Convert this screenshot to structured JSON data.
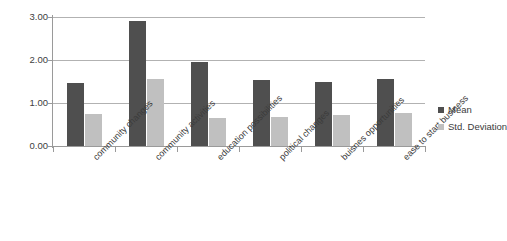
{
  "chart_data": {
    "type": "bar",
    "title": "",
    "xlabel": "",
    "ylabel": "",
    "ylim": [
      0.0,
      3.0
    ],
    "yticks": [
      "0.00",
      "1.00",
      "2.00",
      "3.00"
    ],
    "ytick_values": [
      0.0,
      1.0,
      2.0,
      3.0
    ],
    "grid": true,
    "legend_position": "right",
    "categories": [
      "community changes",
      "community activities",
      "education possibilities",
      "political changes",
      "buisnes opportunities",
      "ease to start business"
    ],
    "series": [
      {
        "name": "Mean",
        "color": "#4f4f4f",
        "values": [
          1.47,
          2.91,
          1.95,
          1.54,
          1.5,
          1.55
        ]
      },
      {
        "name": "Std. Deviation",
        "color": "#c0c0c0",
        "values": [
          0.74,
          1.56,
          0.66,
          0.67,
          0.73,
          0.77
        ]
      }
    ]
  },
  "legend": {
    "items": [
      {
        "label": "Mean",
        "swatch": "mean"
      },
      {
        "label": "Std. Deviation",
        "swatch": "sd"
      }
    ]
  },
  "colors": {
    "mean": "#4f4f4f",
    "std_deviation": "#c0c0c0",
    "gridline": "#b2b2b2",
    "axis": "#9a9a9a",
    "text": "#3b3b3b",
    "background": "#ffffff"
  }
}
